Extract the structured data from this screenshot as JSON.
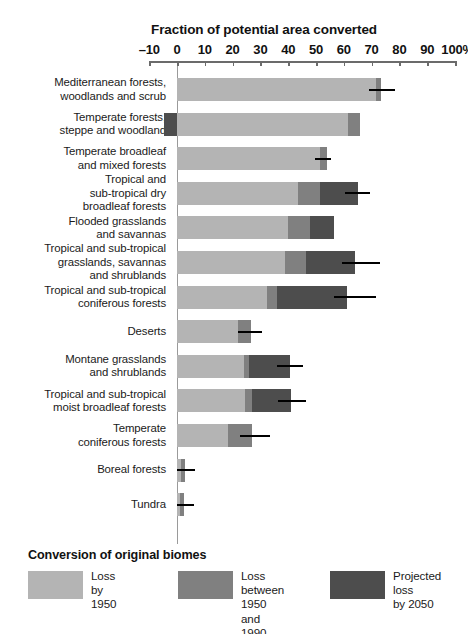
{
  "chart_data": {
    "type": "bar",
    "orientation": "horizontal",
    "stacked": true,
    "title": "Fraction of potential area converted",
    "xlabel": "",
    "ylabel": "",
    "xlim": [
      -10,
      100
    ],
    "xticks": [
      -10,
      0,
      10,
      20,
      30,
      40,
      50,
      60,
      70,
      80,
      90,
      100
    ],
    "xtick_labels": [
      "–10",
      "0",
      "10",
      "20",
      "30",
      "40",
      "50",
      "60",
      "70",
      "80",
      "90",
      "100%"
    ],
    "grid": false,
    "legend_position": "bottom-left",
    "legend_title": "Conversion of original biomes",
    "series": [
      {
        "name": "Loss by\n1950",
        "color": "#b4b4b4"
      },
      {
        "name": "Loss between\n1950 and 1990",
        "color": "#808080"
      },
      {
        "name": "Projected loss\nby 2050",
        "color": "#4d4d4d"
      }
    ],
    "categories": [
      "Mediterranean forests,\nwoodlands and scrub",
      "Temperate forests,\nsteppe and woodland",
      "Temperate broadleaf\nand mixed forests",
      "Tropical and\nsub-tropical dry\nbroadleaf forests",
      "Flooded grasslands\nand savannas",
      "Tropical and sub-tropical\ngrasslands, savannas\nand shrublands",
      "Tropical and sub-tropical\nconiferous forests",
      "Deserts",
      "Montane grasslands\nand shrublands",
      "Tropical and sub-tropical\nmoist broadleaf forests",
      "Temperate\nconiferous forests",
      "Boreal forests",
      "Tundra"
    ],
    "values": {
      "loss_by_1950": [
        71.5,
        61.5,
        51.5,
        43.5,
        40.0,
        39.0,
        32.5,
        22.0,
        24.0,
        24.5,
        18.5,
        1.5,
        1.0
      ],
      "loss_1950_to_1990": [
        2.0,
        4.5,
        2.5,
        8.0,
        8.0,
        7.5,
        3.5,
        4.5,
        2.0,
        2.5,
        8.5,
        1.5,
        1.5
      ],
      "projected_loss_by_2050": [
        0.0,
        0.0,
        0.0,
        13.5,
        8.5,
        17.5,
        25.0,
        0.0,
        14.5,
        14.0,
        0.0,
        0.0,
        0.0
      ],
      "negative_extension": [
        0.0,
        4.5,
        0.0,
        0.0,
        0.0,
        0.0,
        0.0,
        0.0,
        0.0,
        0.0,
        0.0,
        0.0,
        0.0
      ],
      "projection_marker": [
        78.5,
        null,
        55.5,
        69.5,
        null,
        73.0,
        71.5,
        30.5,
        45.5,
        46.5,
        33.5,
        6.5,
        6.0
      ]
    }
  },
  "legend": {
    "title": "Conversion of original biomes",
    "items": [
      {
        "label": "Loss by\n1950",
        "color": "#b4b4b4"
      },
      {
        "label": "Loss between\n1950 and 1990",
        "color": "#808080"
      },
      {
        "label": "Projected loss\nby 2050",
        "color": "#4d4d4d"
      }
    ]
  }
}
